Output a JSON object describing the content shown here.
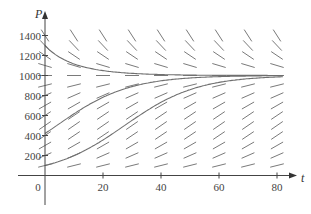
{
  "chart_data": {
    "type": "line",
    "title": "",
    "subtitle": "Direction (slope) field for logistic equation with solution curves",
    "xlabel": "t",
    "ylabel": "P",
    "xlim": [
      0,
      85
    ],
    "ylim": [
      -150,
      1500
    ],
    "x_ticks": [
      0,
      20,
      40,
      60,
      80
    ],
    "x_tick_labels": [
      "0",
      "20",
      "40",
      "60",
      "80"
    ],
    "y_ticks": [
      200,
      400,
      600,
      800,
      1000,
      1200,
      1400
    ],
    "y_tick_labels": [
      "200",
      "400",
      "600",
      "800",
      "1000",
      "1200",
      "1400"
    ],
    "grid": false,
    "legend": null,
    "equilibrium": 1000,
    "growth_rate_k": 0.08,
    "slope_field": {
      "t_values": [
        0,
        10,
        20,
        30,
        40,
        50,
        60,
        70,
        80
      ],
      "P_values": [
        100,
        200,
        300,
        400,
        500,
        600,
        700,
        800,
        900,
        1000,
        1100,
        1200,
        1300,
        1400
      ]
    },
    "series": [
      {
        "name": "P(0)=1300",
        "P0": 1300,
        "t": [
          0,
          10,
          20,
          40,
          60,
          80
        ],
        "values": [
          1300,
          1100,
          1025,
          1002,
          1000,
          1000
        ]
      },
      {
        "name": "P(0)=420",
        "P0": 420,
        "t": [
          0,
          10,
          20,
          30,
          40,
          60,
          80
        ],
        "values": [
          420,
          610,
          780,
          890,
          950,
          993,
          999
        ]
      },
      {
        "name": "P(0)=100",
        "P0": 100,
        "t": [
          0,
          10,
          20,
          30,
          40,
          50,
          60,
          80
        ],
        "values": [
          100,
          200,
          360,
          550,
          740,
          870,
          945,
          990
        ]
      }
    ]
  }
}
